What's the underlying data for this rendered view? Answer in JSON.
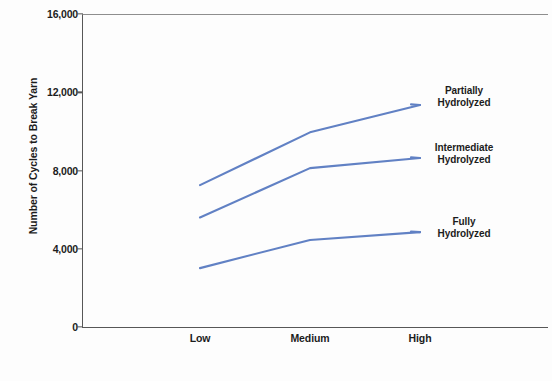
{
  "chart_data": {
    "type": "line",
    "title": "",
    "subtitle": "",
    "xlabel": "Viscosity",
    "ylabel": "Number of Cycles to Break Yarn",
    "categories": [
      "Low",
      "Medium",
      "High"
    ],
    "ytick_labels": [
      "0",
      "4,000",
      "8,000",
      "12,000",
      "16,000"
    ],
    "ytick_values": [
      0,
      4000,
      8000,
      12000,
      16000
    ],
    "ylim": [
      0,
      16000
    ],
    "grid": false,
    "legend_position": "inline-right-annotations",
    "line_color": "#6181c4",
    "series": [
      {
        "name": "Partially Hydrolyzed",
        "label_line1": "Partially",
        "label_line2": "Hydrolyzed",
        "values": [
          7250,
          9950,
          11350
        ]
      },
      {
        "name": "Intermediate Hydrolyzed",
        "label_line1": "Intermediate",
        "label_line2": "Hydrolyzed",
        "values": [
          5600,
          8120,
          8640
        ]
      },
      {
        "name": "Fully Hydrolyzed",
        "label_line1": "Fully",
        "label_line2": "Hydrolyzed",
        "values": [
          3010,
          4450,
          4850
        ]
      }
    ]
  }
}
